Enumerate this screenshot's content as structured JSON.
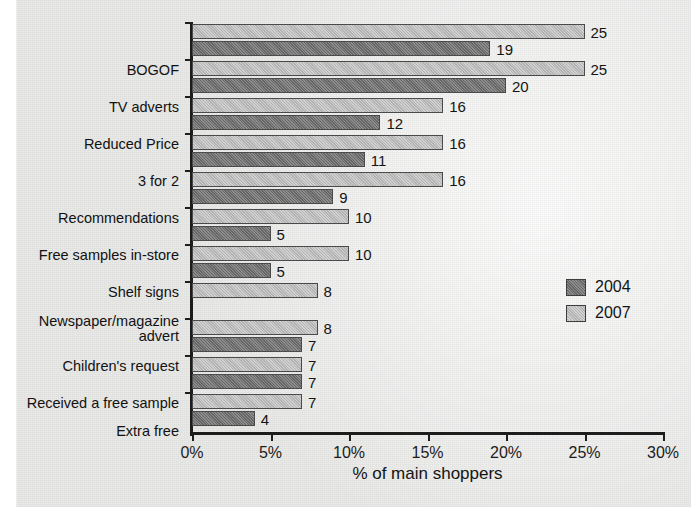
{
  "chart_data": {
    "type": "bar",
    "orientation": "horizontal",
    "title": "",
    "xlabel": "% of main shoppers",
    "ylabel": "",
    "xlim": [
      0,
      30
    ],
    "xticks": [
      "0%",
      "5%",
      "10%",
      "15%",
      "20%",
      "25%",
      "30%"
    ],
    "xtick_values": [
      0,
      5,
      10,
      15,
      20,
      25,
      30
    ],
    "grid": false,
    "legend_position": "right",
    "categories": [
      "BOGOF",
      "TV adverts",
      "Reduced Price",
      "3 for 2",
      "Recommendations",
      "Free samples in-store",
      "Shelf signs",
      "Newspaper/magazine\nadvert",
      "Children's request",
      "Received a free sample",
      "Extra free"
    ],
    "series": [
      {
        "name": "2007",
        "color": "#bcbcbc",
        "values": [
          25,
          25,
          16,
          16,
          16,
          10,
          10,
          8,
          8,
          7,
          7
        ],
        "labels": [
          "25",
          "25",
          "16",
          "16",
          "16",
          "10",
          "10",
          "8",
          "8",
          "7",
          "7"
        ]
      },
      {
        "name": "2004",
        "color": "#6f6f6f",
        "values": [
          19,
          20,
          12,
          11,
          9,
          5,
          5,
          null,
          7,
          7,
          4
        ],
        "labels": [
          "19",
          "20",
          "12",
          "11",
          "9",
          "5",
          "5",
          "",
          "7",
          "7",
          "4"
        ]
      }
    ]
  },
  "legend": {
    "items": [
      {
        "label": "2004",
        "swatch": "s2004"
      },
      {
        "label": "2007",
        "swatch": "s2007"
      }
    ]
  },
  "axis": {
    "x_title": "% of main shoppers"
  }
}
